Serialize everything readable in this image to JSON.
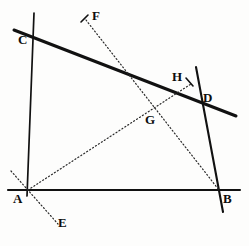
{
  "figure": {
    "kind": "plane-geometry-diagram",
    "width": 249,
    "height": 246,
    "background_color": "#fdfdfc",
    "ink_color": "#111111"
  },
  "points": {
    "A": {
      "label": "A",
      "x": 28,
      "y": 190,
      "label_x": 13,
      "label_y": 192
    },
    "B": {
      "label": "B",
      "x": 218,
      "y": 190,
      "label_x": 223,
      "label_y": 192
    },
    "C": {
      "label": "C",
      "x": 31,
      "y": 36,
      "label_x": 18,
      "label_y": 33
    },
    "D": {
      "label": "D",
      "x": 202,
      "y": 104,
      "label_x": 203,
      "label_y": 91
    },
    "E": {
      "label": "E",
      "x": 57,
      "y": 223,
      "label_x": 58,
      "label_y": 216
    },
    "F": {
      "label": "F",
      "x": 86,
      "y": 19,
      "label_x": 92,
      "label_y": 9
    },
    "G": {
      "label": "G",
      "x": 151,
      "y": 118,
      "label_x": 145,
      "label_y": 113
    },
    "H": {
      "label": "H",
      "x": 191,
      "y": 84,
      "label_x": 172,
      "label_y": 70
    }
  },
  "segments": [
    {
      "name": "segment-AB",
      "from": "A",
      "to": "B",
      "style": "solid",
      "weight": 2.1,
      "x1": 8,
      "y1": 190,
      "x2": 240,
      "y2": 190
    },
    {
      "name": "segment-AC",
      "from": "A",
      "to": "C",
      "style": "solid",
      "weight": 1.7,
      "x1": 34,
      "y1": 13,
      "x2": 27,
      "y2": 196
    },
    {
      "name": "segment-CD",
      "from": "C",
      "to": "D",
      "style": "solid",
      "weight": 3.0,
      "x1": 14,
      "y1": 30,
      "x2": 236,
      "y2": 116
    },
    {
      "name": "segment-BD",
      "from": "D",
      "to": "B",
      "style": "solid",
      "weight": 2.1,
      "x1": 196,
      "y1": 67,
      "x2": 223,
      "y2": 212
    },
    {
      "name": "ray-AH",
      "from": "A",
      "to": "H",
      "style": "dotted",
      "weight": 1.2,
      "x1": 28,
      "y1": 190,
      "x2": 191,
      "y2": 84
    },
    {
      "name": "ray-FB",
      "from": "F",
      "to": "B",
      "style": "dotted",
      "weight": 1.2,
      "x1": 86,
      "y1": 20,
      "x2": 219,
      "y2": 190
    },
    {
      "name": "ray-through-A-to-E",
      "from": "A",
      "to": "E",
      "style": "dotted",
      "weight": 1.2,
      "x1": 11,
      "y1": 171,
      "x2": 58,
      "y2": 224
    }
  ],
  "tick_marks": [
    {
      "name": "tick-at-F",
      "x1": 81,
      "y1": 22,
      "x2": 88,
      "y2": 15
    },
    {
      "name": "tick-at-H",
      "x1": 186,
      "y1": 78,
      "x2": 193,
      "y2": 86
    }
  ],
  "intersections": [
    {
      "name": "intersection-G",
      "label": "G",
      "of": [
        "ray-AH",
        "ray-FB"
      ],
      "x": 151,
      "y": 118
    }
  ]
}
